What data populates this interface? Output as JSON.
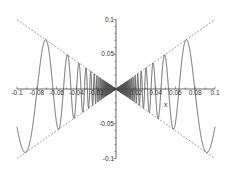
{
  "chart_data": {
    "type": "line",
    "title": "",
    "xlabel": "x",
    "ylabel": "",
    "xlim": [
      -0.1,
      0.1
    ],
    "ylim": [
      -0.1,
      0.1
    ],
    "grid": false,
    "legend": null,
    "x_ticks": [
      -0.1,
      -0.08,
      -0.06,
      -0.04,
      -0.02,
      0.02,
      0.04,
      0.06,
      0.08,
      0.1
    ],
    "x_tick_labels": [
      "-0.1",
      "-0.08",
      "-0.06",
      "-0.04",
      "-0.02",
      "0.02",
      "0.04",
      "0.06",
      "0.08",
      "0.1"
    ],
    "y_ticks": [
      0.1,
      0.05,
      -0.05,
      -0.1
    ],
    "y_tick_labels": [
      "0.1",
      "0.05",
      "-0.05",
      "-0.1"
    ],
    "series": [
      {
        "name": "x*sin(1/x)",
        "style": "solid",
        "expression": "x*sin(1/x)"
      },
      {
        "name": "x",
        "style": "dashed",
        "expression": "x"
      },
      {
        "name": "-x",
        "style": "dashed",
        "expression": "-x"
      }
    ],
    "colors": {
      "curve": "#555555",
      "envelope": "#777777",
      "axis": "#444444"
    }
  }
}
